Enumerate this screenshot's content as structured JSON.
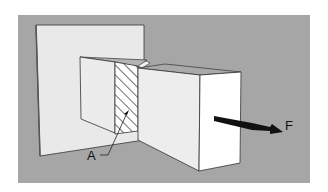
{
  "diagram": {
    "type": "mechanics-illustration",
    "labels": {
      "area": "A",
      "force": "F"
    },
    "colors": {
      "background": "#ffffff",
      "panel": "#a6a6a6",
      "wall": "#e8e8e8",
      "block_light": "#f2f2f2",
      "block_top": "#a9a9a9",
      "edge": "#333333",
      "arrow": "#111111",
      "hatch": "#222222"
    }
  }
}
